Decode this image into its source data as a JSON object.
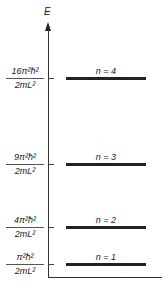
{
  "diagram": {
    "axis_label": "E",
    "levels": [
      {
        "n_label": "n = 4",
        "numerator": "16π²ħ²",
        "denominator": "2mL²",
        "y": 78
      },
      {
        "n_label": "n = 3",
        "numerator": "9π²ħ²",
        "denominator": "2mL²",
        "y": 164
      },
      {
        "n_label": "n = 2",
        "numerator": "4π²ħ²",
        "denominator": "2mL²",
        "y": 227
      },
      {
        "n_label": "n = 1",
        "numerator": "π²ħ²",
        "denominator": "2mL²",
        "y": 264
      }
    ]
  }
}
